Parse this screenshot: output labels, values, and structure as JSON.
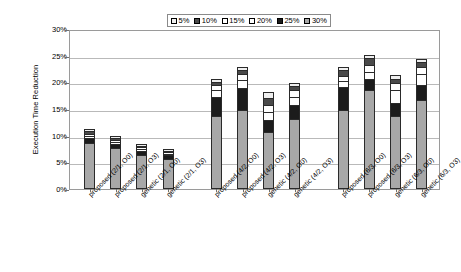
{
  "chart_data": {
    "type": "bar",
    "subtype": "stacked-column",
    "title": "",
    "xlabel": "",
    "ylabel": "Execution Time Reduction",
    "ylim": [
      0,
      0.3
    ],
    "ytick_labels": [
      "0%",
      "5%",
      "10%",
      "15%",
      "20%",
      "25%",
      "30%"
    ],
    "ytick_values": [
      0,
      5,
      10,
      15,
      20,
      25,
      30
    ],
    "grid": true,
    "legend_position": "top-center",
    "legend_entries": [
      "5%",
      "10%",
      "15%",
      "20%",
      "25%",
      "30%"
    ],
    "categories": [
      "proposed (2/1, O0)",
      "proposed (2/1, O3)",
      "genetic (2/1, O0)",
      "genetic (2/1, O3)",
      "proposed (4/2, O0)",
      "proposed (4/2, O3)",
      "genetic (4/2, O0)",
      "genetic (4/2, O3)",
      "proposed (6/3, O0)",
      "proposed (6/3, O3)",
      "genetic (6/3, O0)",
      "genetic (6/3, O3)"
    ],
    "group_gaps_after": [
      3,
      7
    ],
    "series": [
      {
        "name": "30%",
        "color": "#a8a8a8",
        "values": [
          8.6,
          7.6,
          6.4,
          5.6,
          13.6,
          14.9,
          10.6,
          13.1,
          14.8,
          18.6,
          13.6,
          16.7
        ]
      },
      {
        "name": "25%",
        "color": "#1c1c1c",
        "values": [
          1.0,
          0.9,
          0.8,
          0.7,
          3.6,
          4.1,
          2.4,
          2.7,
          4.3,
          2.1,
          2.5,
          2.8
        ]
      },
      {
        "name": "20%",
        "color": "#ffffff",
        "values": [
          0.4,
          0.4,
          0.3,
          0.3,
          1.3,
          1.5,
          1.4,
          1.5,
          1.1,
          1.3,
          2.4,
          2.1
        ]
      },
      {
        "name": "15%",
        "color": "#ffffff",
        "values": [
          0.4,
          0.3,
          0.3,
          0.3,
          1.0,
          1.0,
          1.3,
          1.2,
          1.0,
          1.2,
          1.3,
          1.3
        ]
      },
      {
        "name": "10%",
        "color": "#4a4a4a",
        "values": [
          0.5,
          0.4,
          0.3,
          0.3,
          0.6,
          0.8,
          1.4,
          0.8,
          1.1,
          1.3,
          0.9,
          1.0
        ]
      },
      {
        "name": "5%",
        "color": "#efefef",
        "values": [
          0.4,
          0.3,
          0.3,
          0.3,
          0.5,
          0.5,
          1.1,
          0.5,
          0.6,
          0.7,
          0.6,
          0.5
        ]
      }
    ],
    "totals": [
      11.3,
      9.9,
      8.4,
      7.5,
      20.6,
      22.8,
      18.2,
      19.8,
      22.9,
      25.2,
      21.3,
      24.4
    ]
  }
}
